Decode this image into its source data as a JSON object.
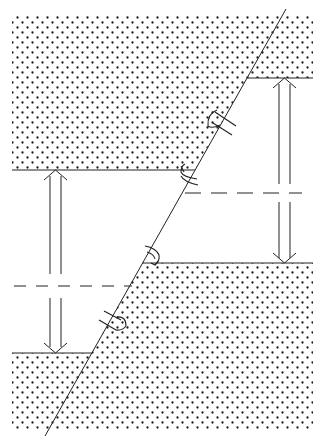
{
  "diagram": {
    "type": "fault-block-displacement",
    "description": "Cross-section of an inclined fault with stippled rock blocks offset vertically; double arrows indicate displacement, curved arrows along the fault indicate relative motion sense.",
    "colors": {
      "background": "#ffffff",
      "line": "#222222",
      "stipple": "#1a1a1a"
    },
    "fault_line": {
      "x1": 48,
      "y1": 430,
      "x2": 283,
      "y2": 14
    },
    "blocks": [
      {
        "name": "upper-left-block",
        "label": "Upper left block"
      },
      {
        "name": "upper-right-block",
        "label": "Upper right block"
      },
      {
        "name": "lower-left-block",
        "label": "Lower left block"
      },
      {
        "name": "lower-right-block",
        "label": "Lower right block"
      }
    ],
    "displacement_arrows": [
      {
        "name": "left-displacement-arrow",
        "x": 55,
        "top": 170,
        "bottom": 353
      },
      {
        "name": "right-displacement-arrow",
        "x": 284,
        "top": 78,
        "bottom": 263
      }
    ],
    "reference_lines": [
      {
        "name": "left-reference-dashed-line",
        "y": 286,
        "x_start": 12,
        "x_end": 132
      },
      {
        "name": "right-reference-dashed-line",
        "y": 193,
        "x_start": 183,
        "x_end": 302
      }
    ],
    "motion_arrows": [
      {
        "name": "upper-slip-arrow",
        "position": "fault upper-left side near y=120"
      },
      {
        "name": "upper-curl-arrow",
        "position": "fault at upper-left block base near y=175"
      },
      {
        "name": "lower-curl-arrow",
        "position": "fault at lower-right block top near y=255"
      },
      {
        "name": "lower-slip-arrow",
        "position": "fault lower-right side near y=322"
      }
    ]
  }
}
